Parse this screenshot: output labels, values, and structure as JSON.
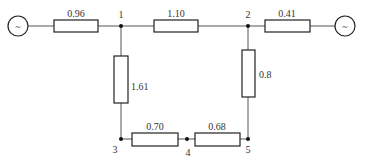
{
  "diagram": {
    "type": "power-network-circuit",
    "nodes": [
      {
        "id": "1",
        "label": "1"
      },
      {
        "id": "2",
        "label": "2"
      },
      {
        "id": "3",
        "label": "3"
      },
      {
        "id": "4",
        "label": "4"
      },
      {
        "id": "5",
        "label": "5"
      }
    ],
    "sources": [
      {
        "id": "src-left",
        "symbol": "~",
        "connects": "1"
      },
      {
        "id": "src-right",
        "symbol": "~",
        "connects": "2"
      }
    ],
    "branches": [
      {
        "id": "src-left-1",
        "from": "src-left",
        "to": "1",
        "value": "0.96"
      },
      {
        "id": "1-2",
        "from": "1",
        "to": "2",
        "value": "1.10"
      },
      {
        "id": "2-src-right",
        "from": "2",
        "to": "src-right",
        "value": "0.41"
      },
      {
        "id": "1-3",
        "from": "1",
        "to": "3",
        "value": "1.61"
      },
      {
        "id": "2-5",
        "from": "2",
        "to": "5",
        "value": "0.8"
      },
      {
        "id": "3-4",
        "from": "3",
        "to": "4",
        "value": "0.70"
      },
      {
        "id": "4-5",
        "from": "4",
        "to": "5",
        "value": "0.68"
      }
    ]
  }
}
